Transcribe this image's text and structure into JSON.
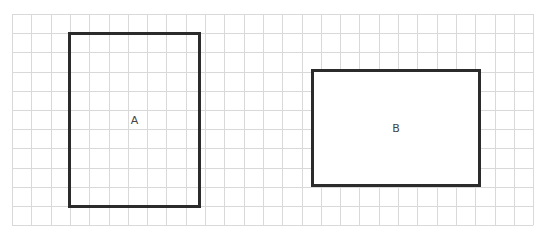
{
  "grid": {
    "origin_x": 12,
    "origin_y": 14,
    "cols": 27,
    "rows": 11,
    "cell_w": 19.3,
    "cell_h": 19.2,
    "line_color": "#d9d9d9"
  },
  "shapes": [
    {
      "label": "A",
      "x": 68,
      "y": 32,
      "w": 133,
      "h": 176,
      "fill": "transparent",
      "border_color": "#2b2b2b"
    },
    {
      "label": "B",
      "x": 311,
      "y": 69,
      "w": 170,
      "h": 118,
      "fill": "#ffffff",
      "border_color": "#2b2b2b"
    }
  ]
}
